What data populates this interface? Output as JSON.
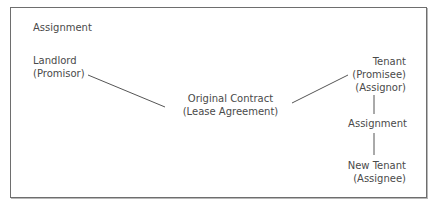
{
  "diagram": {
    "title": "Assignment",
    "nodes": {
      "landlord": {
        "name": "Landlord",
        "role": "(Promisor)"
      },
      "contract": {
        "name": "Original Contract",
        "detail": "(Lease Agreement)"
      },
      "tenant": {
        "name": "Tenant",
        "role1": "(Promisee)",
        "role2": "(Assignor)"
      },
      "assignment": {
        "label": "Assignment"
      },
      "new_tenant": {
        "name": "New Tenant",
        "role": "(Assignee)"
      }
    },
    "edges": [
      {
        "from": "landlord",
        "to": "contract"
      },
      {
        "from": "contract",
        "to": "tenant"
      },
      {
        "from": "tenant",
        "to": "assignment"
      },
      {
        "from": "assignment",
        "to": "new_tenant"
      }
    ],
    "colors": {
      "text": "#4a4a4a",
      "line": "#555555",
      "border": "#6e6e6e"
    }
  }
}
